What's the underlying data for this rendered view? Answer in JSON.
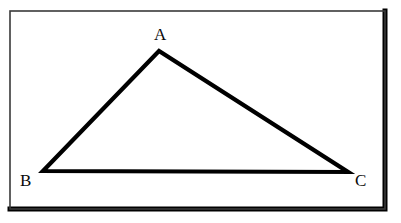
{
  "figure": {
    "background_color": "#ffffff",
    "frame": {
      "name": "rectangular-border",
      "x": 10,
      "y": 11,
      "width": 375,
      "height": 198,
      "stroke_color": "#3a3a3a",
      "shadow_color": "#000000",
      "thin_stroke_width": 1.6,
      "thick_stroke_width": 5
    },
    "shape": {
      "name": "triangle",
      "type": "triangle",
      "stroke_color": "#000000",
      "fill_color": "none",
      "stroke_width": 4.2,
      "vertices": [
        {
          "label": "A",
          "x": 159,
          "y": 51
        },
        {
          "label": "B",
          "x": 43,
          "y": 171
        },
        {
          "label": "C",
          "x": 348,
          "y": 172
        }
      ],
      "points_path": "159,51 43,171 348,172"
    },
    "labels": [
      {
        "id": "A",
        "text": "A",
        "x": 154,
        "y": 26
      },
      {
        "id": "B",
        "text": "B",
        "x": 20,
        "y": 172
      },
      {
        "id": "C",
        "text": "C",
        "x": 355,
        "y": 172
      }
    ]
  }
}
